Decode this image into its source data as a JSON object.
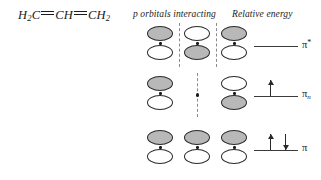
{
  "molecule": {
    "label": "H2C=CH=CH2",
    "parts": [
      {
        "text": "H",
        "sub": "2"
      },
      {
        "text": "C",
        "sub": ""
      },
      {
        "bond": "double-dash"
      },
      {
        "text": "CH",
        "sub": ""
      },
      {
        "bond": "double-dash"
      },
      {
        "text": "CH",
        "sub": "2"
      }
    ]
  },
  "headings": {
    "orbitals": "p orbitals interacting",
    "energy": "Relative energy"
  },
  "chart_data": {
    "type": "diagram",
    "subtitle": "p orbitals interacting / Relative energy",
    "molecule_formula": "H2C=CH=CH2",
    "n_orbitals": 3,
    "levels": [
      {
        "name": "pi-star",
        "label": "π",
        "superscript": "*",
        "subscript": "",
        "energy_rank": 3,
        "electrons": 0,
        "electron_spins": [],
        "nodes": 2,
        "lobes": [
          {
            "top": "shaded",
            "bottom": "white"
          },
          {
            "top": "white",
            "bottom": "shaded"
          },
          {
            "top": "shaded",
            "bottom": "white"
          }
        ],
        "node_lines": [
          "between-1-2",
          "between-2-3"
        ]
      },
      {
        "name": "pi-nonbonding",
        "label": "π",
        "superscript": "",
        "subscript": "n",
        "energy_rank": 2,
        "electrons": 1,
        "electron_spins": [
          "up"
        ],
        "nodes": 1,
        "lobes": [
          {
            "top": "shaded",
            "bottom": "white"
          },
          {
            "top": "none",
            "bottom": "none"
          },
          {
            "top": "white",
            "bottom": "shaded"
          }
        ],
        "node_lines": [
          "center-through-atom-2"
        ]
      },
      {
        "name": "pi-bonding",
        "label": "π",
        "superscript": "",
        "subscript": "",
        "energy_rank": 1,
        "electrons": 2,
        "electron_spins": [
          "up",
          "down"
        ],
        "nodes": 0,
        "lobes": [
          {
            "top": "shaded",
            "bottom": "white"
          },
          {
            "top": "shaded",
            "bottom": "white"
          },
          {
            "top": "shaded",
            "bottom": "white"
          }
        ],
        "node_lines": []
      }
    ],
    "colors": {
      "shaded_lobe": "#b8b8b8",
      "white_lobe": "#ffffff",
      "outline": "#2a2a2a",
      "node_line": "#8a8a8a",
      "energy_line": "#3a3a3a"
    }
  }
}
